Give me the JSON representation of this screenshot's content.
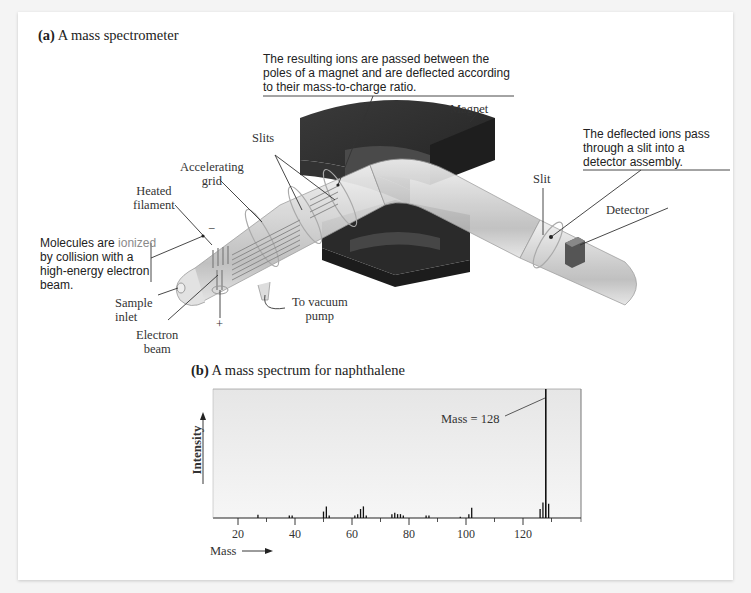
{
  "figure": {
    "part_a": {
      "label": "(a)",
      "title": "A mass spectrometer",
      "callouts": {
        "magnet_deflection": [
          "The resulting ions are passed between the",
          "poles of a magnet and are deflected according",
          "to their mass-to-charge ratio."
        ],
        "detector_pass": [
          "The deflected ions pass",
          "through a slit into a",
          "detector assembly."
        ],
        "ionized_prefix": "Molecules are ",
        "ionized_word": "ionized",
        "ionized_rest": [
          "by collision with a",
          "high-energy electron",
          "beam."
        ]
      },
      "labels": {
        "magnet": "Magnet",
        "slits": "Slits",
        "slit": "Slit",
        "detector": "Detector",
        "accelerating_grid": [
          "Accelerating",
          "grid"
        ],
        "heated_filament": [
          "Heated",
          "filament"
        ],
        "sample_inlet": [
          "Sample",
          "inlet"
        ],
        "electron_beam": [
          "Electron",
          "beam"
        ],
        "vacuum_pump": [
          "To vacuum",
          "pump"
        ],
        "minus": "−",
        "plus": "+"
      }
    },
    "part_b": {
      "label": "(b)",
      "title": "A mass spectrum for naphthalene",
      "annotation": "Mass = 128",
      "ylabel": "Intensity",
      "xlabel": "Mass"
    }
  },
  "colors": {
    "plot_bg": "#ececec",
    "magnet": "#2e2e2e",
    "tube": "#c8c8c8",
    "ionized": "#8a8a8a"
  },
  "chart_data": {
    "type": "bar",
    "title": "A mass spectrum for naphthalene",
    "xlabel": "Mass",
    "ylabel": "Intensity",
    "xlim": [
      11,
      141
    ],
    "ylim": [
      0,
      100
    ],
    "xticks": [
      20,
      40,
      60,
      80,
      100,
      120
    ],
    "minor_ticks": [
      30,
      50,
      70,
      90,
      110,
      130
    ],
    "grid": false,
    "annotation": {
      "text": "Mass = 128",
      "x": 128
    },
    "peaks": [
      {
        "mass": 27,
        "intensity": 2.5
      },
      {
        "mass": 38,
        "intensity": 2
      },
      {
        "mass": 39,
        "intensity": 2
      },
      {
        "mass": 50,
        "intensity": 5
      },
      {
        "mass": 51,
        "intensity": 9
      },
      {
        "mass": 52,
        "intensity": 2
      },
      {
        "mass": 61,
        "intensity": 2
      },
      {
        "mass": 62,
        "intensity": 3
      },
      {
        "mass": 63,
        "intensity": 7
      },
      {
        "mass": 64,
        "intensity": 9
      },
      {
        "mass": 65,
        "intensity": 2
      },
      {
        "mass": 74,
        "intensity": 3
      },
      {
        "mass": 75,
        "intensity": 4
      },
      {
        "mass": 76,
        "intensity": 3
      },
      {
        "mass": 77,
        "intensity": 3
      },
      {
        "mass": 78,
        "intensity": 2
      },
      {
        "mass": 86,
        "intensity": 2
      },
      {
        "mass": 87,
        "intensity": 2
      },
      {
        "mass": 98,
        "intensity": 1
      },
      {
        "mass": 101,
        "intensity": 3
      },
      {
        "mass": 102,
        "intensity": 8
      },
      {
        "mass": 126,
        "intensity": 7
      },
      {
        "mass": 127,
        "intensity": 12
      },
      {
        "mass": 128,
        "intensity": 100
      },
      {
        "mass": 129,
        "intensity": 11
      }
    ]
  }
}
